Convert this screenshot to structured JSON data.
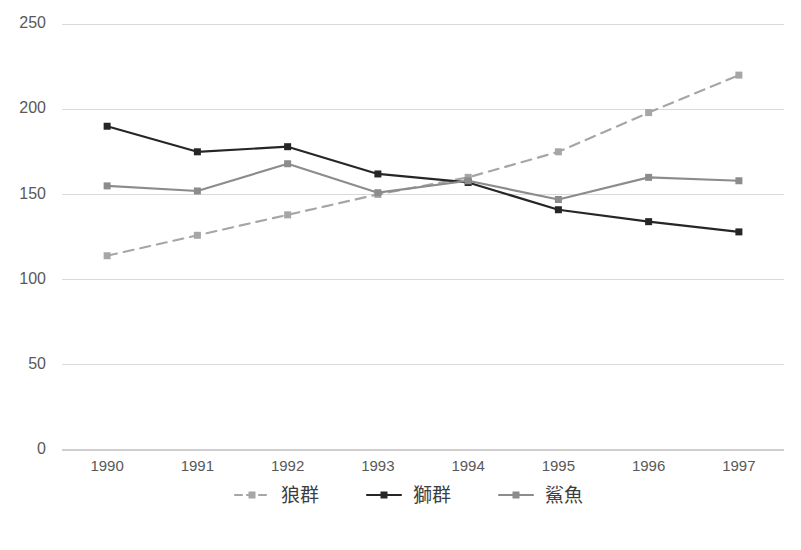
{
  "chart_data": {
    "type": "line",
    "title": "",
    "subtitle": "",
    "xlabel": "",
    "ylabel": "",
    "categories": [
      "1990",
      "1991",
      "1992",
      "1993",
      "1994",
      "1995",
      "1996",
      "1997"
    ],
    "x": [
      1990,
      1991,
      1992,
      1993,
      1994,
      1995,
      1996,
      1997
    ],
    "ylim": [
      0,
      250
    ],
    "yticks": [
      0,
      50,
      100,
      150,
      200,
      250
    ],
    "ytick_labels": [
      "0",
      "50",
      "100",
      "150",
      "200",
      "250"
    ],
    "grid": true,
    "grid_axis": "y",
    "legend_position": "bottom",
    "series": [
      {
        "name": "狼群",
        "style": "dashed",
        "color": "#a6a6a6",
        "marker": "square",
        "values": [
          114,
          126,
          138,
          150,
          160,
          175,
          198,
          220
        ]
      },
      {
        "name": "獅群",
        "style": "solid",
        "color": "#262626",
        "marker": "square",
        "values": [
          190,
          175,
          178,
          162,
          157,
          141,
          134,
          128
        ]
      },
      {
        "name": "鯊魚",
        "style": "solid",
        "color": "#8c8c8c",
        "marker": "square",
        "values": [
          155,
          152,
          168,
          151,
          158,
          147,
          160,
          158
        ]
      }
    ]
  },
  "legend": {
    "items": [
      {
        "label": "狼群",
        "color": "#a6a6a6",
        "style": "dashed"
      },
      {
        "label": "獅群",
        "color": "#262626",
        "style": "solid"
      },
      {
        "label": "鯊魚",
        "color": "#8c8c8c",
        "style": "solid"
      }
    ]
  },
  "colors": {
    "background": "#ffffff",
    "gridline": "#d9d9d9",
    "axis": "#cfcfcf",
    "tick_text": "#595959",
    "legend_text": "#3d3d3d",
    "series_wolves": "#a6a6a6",
    "series_lions": "#262626",
    "series_sharks": "#8c8c8c"
  }
}
